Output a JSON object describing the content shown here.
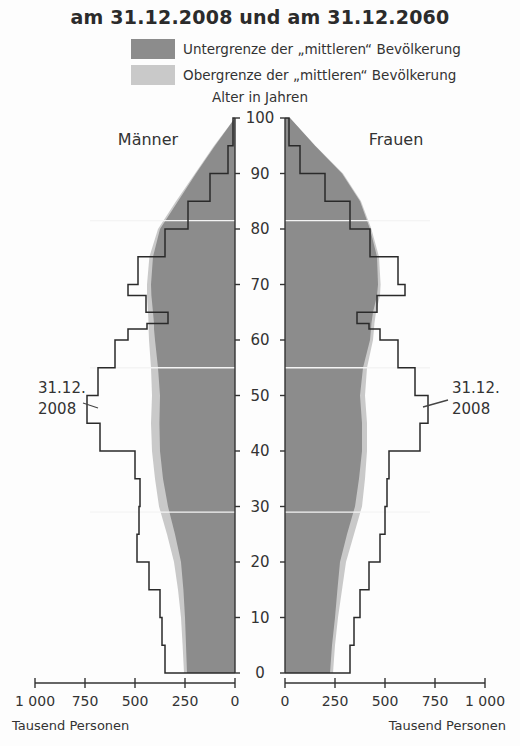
{
  "title": "am 31.12.2008 und am 31.12.2060",
  "legend": [
    {
      "label": "Untergrenze der „mittleren“ Bevölkerung",
      "color": "#8c8c8c"
    },
    {
      "label": "Obergrenze der „mittleren“ Bevölkerung",
      "color": "#c9c9c9"
    }
  ],
  "y_axis_label": "Alter in Jahren",
  "left_panel_label": "Männer",
  "right_panel_label": "Frauen",
  "annotation_left": {
    "line1": "31.12.",
    "line2": "2008"
  },
  "annotation_right": {
    "line1": "31.12.",
    "line2": "2008"
  },
  "x_axis_unit_left": "Tausend Personen",
  "x_axis_unit_right": "Tausend Personen",
  "chart_data": {
    "type": "bar",
    "subtype": "population-pyramid",
    "title": "am 31.12.2008 und am 31.12.2060",
    "ylabel": "Alter in Jahren",
    "xlabel": "Tausend Personen",
    "y_ticks": [
      0,
      10,
      20,
      30,
      40,
      50,
      60,
      70,
      80,
      90,
      100
    ],
    "x_ticks_left": [
      "1 000",
      "750",
      "500",
      "250",
      "0"
    ],
    "x_ticks_right": [
      "0",
      "250",
      "500",
      "750",
      "1 000"
    ],
    "xlim": [
      0,
      1000
    ],
    "ylim": [
      0,
      100
    ],
    "ages": [
      0,
      5,
      10,
      15,
      20,
      25,
      30,
      35,
      40,
      45,
      50,
      55,
      60,
      62,
      63,
      65,
      68,
      70,
      75,
      80,
      85,
      90,
      95,
      100
    ],
    "series": [
      {
        "name": "Männer 2060 Untergrenze",
        "sex": "male",
        "style": "fill-dark",
        "values": [
          240,
          245,
          250,
          258,
          270,
          300,
          335,
          360,
          375,
          378,
          375,
          385,
          400,
          405,
          405,
          410,
          418,
          420,
          410,
          375,
          285,
          195,
          100,
          0
        ]
      },
      {
        "name": "Männer 2060 Obergrenze",
        "sex": "male",
        "style": "fill-light",
        "values": [
          255,
          262,
          270,
          285,
          305,
          340,
          380,
          400,
          415,
          420,
          415,
          420,
          430,
          432,
          432,
          435,
          440,
          440,
          428,
          385,
          295,
          200,
          105,
          0
        ]
      },
      {
        "name": "Männer 31.12.2008",
        "sex": "male",
        "style": "line",
        "values": [
          350,
          365,
          375,
          430,
          490,
          480,
          475,
          500,
          675,
          740,
          685,
          600,
          535,
          440,
          335,
          445,
          535,
          485,
          350,
          235,
          125,
          35,
          10,
          0
        ]
      },
      {
        "name": "Frauen 2060 Untergrenze",
        "sex": "female",
        "style": "fill-dark",
        "values": [
          225,
          235,
          250,
          262,
          275,
          310,
          350,
          370,
          385,
          385,
          375,
          390,
          425,
          430,
          432,
          440,
          460,
          465,
          460,
          425,
          375,
          285,
          150,
          25
        ]
      },
      {
        "name": "Frauen 2060 Obergrenze",
        "sex": "female",
        "style": "fill-light",
        "values": [
          240,
          250,
          265,
          285,
          305,
          345,
          385,
          400,
          410,
          410,
          400,
          410,
          440,
          445,
          447,
          455,
          475,
          478,
          470,
          432,
          380,
          290,
          152,
          25
        ]
      },
      {
        "name": "Frauen 31.12.2008",
        "sex": "female",
        "style": "line",
        "values": [
          325,
          345,
          375,
          420,
          475,
          500,
          510,
          520,
          675,
          715,
          650,
          565,
          475,
          420,
          360,
          460,
          600,
          565,
          425,
          325,
          200,
          75,
          20,
          0
        ]
      }
    ]
  }
}
